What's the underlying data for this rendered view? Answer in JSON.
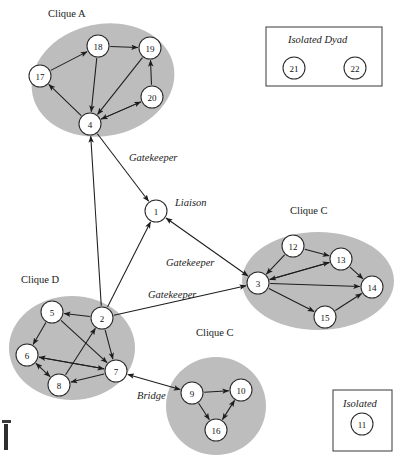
{
  "diagram": {
    "colors": {
      "cluster_fill": "#bdbdbd",
      "node_fill": "#ffffff",
      "edge": "#1d1d1d",
      "box_stroke": "#4a4a4a",
      "text": "#1a1a1a"
    },
    "cluster_labels": [
      {
        "text": "Clique A",
        "x": 48,
        "y": 8
      },
      {
        "text": "Clique C",
        "x": 290,
        "y": 205
      },
      {
        "text": "Clique D",
        "x": 21,
        "y": 274
      },
      {
        "text": "Clique C",
        "x": 196,
        "y": 327
      }
    ],
    "role_labels": [
      {
        "text": "Gatekeeper",
        "x": 129,
        "y": 152
      },
      {
        "text": "Liaison",
        "x": 175,
        "y": 197
      },
      {
        "text": "Gatekeeper",
        "x": 166,
        "y": 257
      },
      {
        "text": "Gatekeeper",
        "x": 148,
        "y": 289
      },
      {
        "text": "Bridge",
        "x": 137,
        "y": 390
      }
    ],
    "boxes": [
      {
        "name": "isolated-dyad",
        "label": "Isolated Dyad",
        "x": 266,
        "y": 27,
        "w": 116,
        "h": 59,
        "label_x": 288,
        "label_y": 34
      },
      {
        "name": "isolated",
        "label": "Isolated",
        "x": 333,
        "y": 390,
        "w": 59,
        "h": 61,
        "label_x": 343,
        "label_y": 398
      }
    ],
    "clusters": [
      {
        "name": "clique-a",
        "cx": 103,
        "cy": 80,
        "rx": 72,
        "ry": 56,
        "rot": -12
      },
      {
        "name": "clique-c",
        "cx": 318,
        "cy": 281,
        "rx": 76,
        "ry": 49,
        "rot": 0
      },
      {
        "name": "clique-d",
        "cx": 72,
        "cy": 348,
        "rx": 63,
        "ry": 52,
        "rot": 0
      },
      {
        "name": "clique-b-bridge",
        "cx": 216,
        "cy": 406,
        "rx": 50,
        "ry": 49,
        "rot": 0
      }
    ],
    "nodes": [
      {
        "id": "17",
        "x": 40,
        "y": 76,
        "r": 11
      },
      {
        "id": "18",
        "x": 98,
        "y": 46,
        "r": 11
      },
      {
        "id": "19",
        "x": 150,
        "y": 48,
        "r": 11
      },
      {
        "id": "20",
        "x": 152,
        "y": 97,
        "r": 11
      },
      {
        "id": "4",
        "x": 90,
        "y": 124,
        "r": 11
      },
      {
        "id": "1",
        "x": 156,
        "y": 211,
        "r": 11
      },
      {
        "id": "12",
        "x": 293,
        "y": 246,
        "r": 11
      },
      {
        "id": "13",
        "x": 341,
        "y": 259,
        "r": 11
      },
      {
        "id": "3",
        "x": 258,
        "y": 283,
        "r": 11
      },
      {
        "id": "14",
        "x": 372,
        "y": 287,
        "r": 11
      },
      {
        "id": "15",
        "x": 325,
        "y": 317,
        "r": 11
      },
      {
        "id": "5",
        "x": 52,
        "y": 312,
        "r": 11
      },
      {
        "id": "2",
        "x": 102,
        "y": 318,
        "r": 11
      },
      {
        "id": "6",
        "x": 27,
        "y": 355,
        "r": 11
      },
      {
        "id": "7",
        "x": 116,
        "y": 371,
        "r": 11
      },
      {
        "id": "8",
        "x": 59,
        "y": 385,
        "r": 11
      },
      {
        "id": "9",
        "x": 192,
        "y": 393,
        "r": 11
      },
      {
        "id": "10",
        "x": 241,
        "y": 390,
        "r": 11
      },
      {
        "id": "16",
        "x": 216,
        "y": 430,
        "r": 11
      },
      {
        "id": "21",
        "x": 294,
        "y": 68,
        "r": 11
      },
      {
        "id": "22",
        "x": 355,
        "y": 68,
        "r": 11
      },
      {
        "id": "11",
        "x": 362,
        "y": 424,
        "r": 11
      }
    ],
    "edges": [
      {
        "from": "18",
        "to": "19",
        "dir": "one"
      },
      {
        "from": "17",
        "to": "18",
        "dir": "one"
      },
      {
        "from": "18",
        "to": "4",
        "dir": "one"
      },
      {
        "from": "19",
        "to": "4",
        "dir": "one"
      },
      {
        "from": "4",
        "to": "17",
        "dir": "one"
      },
      {
        "from": "20",
        "to": "19",
        "dir": "one"
      },
      {
        "from": "4",
        "to": "20",
        "dir": "one"
      },
      {
        "from": "20",
        "to": "4",
        "dir": "one"
      },
      {
        "from": "4",
        "to": "1",
        "dir": "one"
      },
      {
        "from": "2",
        "to": "4",
        "dir": "one"
      },
      {
        "from": "2",
        "to": "1",
        "dir": "one"
      },
      {
        "from": "1",
        "to": "3",
        "dir": "both"
      },
      {
        "from": "2",
        "to": "3",
        "dir": "one"
      },
      {
        "from": "12",
        "to": "13",
        "dir": "one"
      },
      {
        "from": "12",
        "to": "3",
        "dir": "one"
      },
      {
        "from": "13",
        "to": "3",
        "dir": "one"
      },
      {
        "from": "3",
        "to": "13",
        "dir": "one"
      },
      {
        "from": "13",
        "to": "14",
        "dir": "one"
      },
      {
        "from": "3",
        "to": "14",
        "dir": "one"
      },
      {
        "from": "3",
        "to": "15",
        "dir": "one"
      },
      {
        "from": "15",
        "to": "14",
        "dir": "one"
      },
      {
        "from": "2",
        "to": "5",
        "dir": "one"
      },
      {
        "from": "5",
        "to": "6",
        "dir": "one"
      },
      {
        "from": "5",
        "to": "7",
        "dir": "one"
      },
      {
        "from": "2",
        "to": "7",
        "dir": "one"
      },
      {
        "from": "8",
        "to": "2",
        "dir": "one"
      },
      {
        "from": "6",
        "to": "8",
        "dir": "both"
      },
      {
        "from": "7",
        "to": "6",
        "dir": "one"
      },
      {
        "from": "6",
        "to": "7",
        "dir": "one"
      },
      {
        "from": "7",
        "to": "8",
        "dir": "one"
      },
      {
        "from": "7",
        "to": "9",
        "dir": "both"
      },
      {
        "from": "9",
        "to": "10",
        "dir": "one"
      },
      {
        "from": "9",
        "to": "16",
        "dir": "one"
      },
      {
        "from": "16",
        "to": "10",
        "dir": "both"
      },
      {
        "from": "21",
        "to": "22",
        "dir": "one"
      }
    ]
  }
}
